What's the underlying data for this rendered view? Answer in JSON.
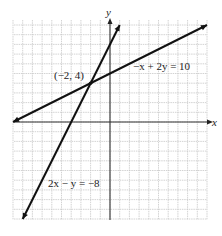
{
  "chart_data": {
    "type": "line",
    "title": "",
    "xlabel": "x",
    "ylabel": "y",
    "xlim": [
      -10,
      10
    ],
    "ylim": [
      -10,
      10
    ],
    "grid": true,
    "grid_step": 1,
    "series": [
      {
        "name": "-x + 2y = 10",
        "equation": "y = 0.5x + 5",
        "x": [
          -10,
          10
        ],
        "y": [
          0,
          10
        ],
        "label": "−x + 2y = 10"
      },
      {
        "name": "2x - y = -8",
        "equation": "y = 2x + 8",
        "x": [
          -9,
          1
        ],
        "y": [
          -10,
          10
        ],
        "label": "2x − y = −8"
      }
    ],
    "annotations": [
      {
        "text": "(−2, 4)",
        "x": -2,
        "y": 4,
        "type": "intersection-point"
      }
    ]
  },
  "labels": {
    "x_axis": "x",
    "y_axis": "y",
    "line1": "−x + 2y = 10",
    "line2": "2x − y = −8",
    "intersection": "(−2, 4)"
  }
}
